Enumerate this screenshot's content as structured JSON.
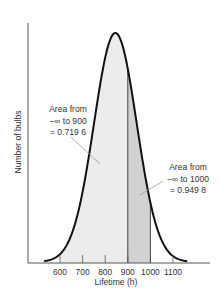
{
  "chart_data": {
    "type": "area",
    "title": "",
    "xlabel": "Lifetime (h)",
    "ylabel": "Number of bulbs",
    "x_ticks": [
      600,
      700,
      800,
      900,
      1000,
      1100
    ],
    "xlim": [
      530,
      1165
    ],
    "distribution": {
      "kind": "normal",
      "mean": 845,
      "sd": 94.3
    },
    "regions": [
      {
        "name": "-inf to 900",
        "from": 600,
        "to": 900,
        "fill": "#ececec"
      },
      {
        "name": "900 to 1000",
        "from": 900,
        "to": 1000,
        "fill": "#d2d2d2"
      }
    ],
    "annotations": [
      {
        "lines": [
          "Area from",
          "−∞ to 900",
          "= 0.719 6"
        ],
        "value": 0.7196
      },
      {
        "lines": [
          "Area from",
          "−∞ to 1000",
          "= 0.949 8"
        ],
        "value": 0.9498
      }
    ],
    "grid": false,
    "legend": "none"
  },
  "colors": {
    "curve": "#111111",
    "axis": "#555555",
    "light_fill": "#ececec",
    "dark_fill": "#d2d2d2",
    "leader": "#9a9a9a"
  }
}
